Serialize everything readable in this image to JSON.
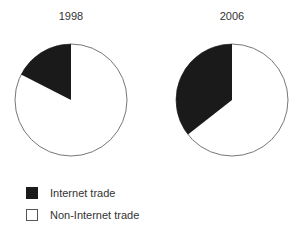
{
  "chart_data": [
    {
      "type": "pie",
      "title": "1998",
      "categories": [
        "Internet trade",
        "Non-Internet trade"
      ],
      "values": [
        17.5,
        82.5
      ],
      "colors": [
        "#1a1a1a",
        "#ffffff"
      ]
    },
    {
      "type": "pie",
      "title": "2006",
      "categories": [
        "Internet trade",
        "Non-Internet trade"
      ],
      "values": [
        35.6,
        64.4
      ],
      "colors": [
        "#1a1a1a",
        "#ffffff"
      ]
    }
  ],
  "titles": {
    "left": "1998",
    "right": "2006"
  },
  "legend": {
    "position": "bottom-left",
    "items": [
      {
        "label": "Internet trade",
        "color": "#1a1a1a"
      },
      {
        "label": "Non-Internet trade",
        "color": "#ffffff"
      }
    ]
  }
}
